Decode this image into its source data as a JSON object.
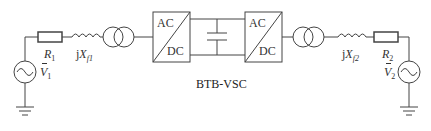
{
  "diagram": {
    "caption": "BTB-VSC",
    "left_source": {
      "symbol": "V",
      "subscript": "1"
    },
    "right_source": {
      "symbol": "V",
      "subscript": "2"
    },
    "left_resistor": {
      "symbol": "R",
      "subscript": "1"
    },
    "right_resistor": {
      "symbol": "R",
      "subscript": "2"
    },
    "left_reactance": {
      "prefix": "j",
      "symbol": "X",
      "subscript": "f1"
    },
    "right_reactance": {
      "prefix": "j",
      "symbol": "X",
      "subscript": "f2"
    },
    "converter_left": {
      "top": "AC",
      "bottom": "DC"
    },
    "converter_right": {
      "top": "AC",
      "bottom": "DC"
    },
    "line_color": "#444444"
  }
}
